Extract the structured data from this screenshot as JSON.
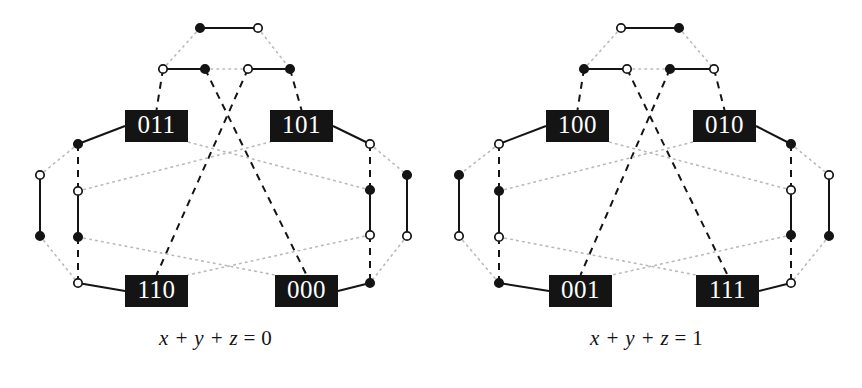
{
  "figure": {
    "background_color": "#ffffff",
    "ink_color": "#141414",
    "box_fill_color": "#141414",
    "box_text_color": "#ffffff",
    "dotted_color": "#b9b9b9",
    "width": 862,
    "height": 388
  },
  "panels": [
    {
      "id": "left",
      "caption": {
        "lhs": "x + y + z",
        "eq": "=",
        "rhs": "0",
        "full": "x + y + z = 0"
      },
      "boxes": [
        {
          "id": "box-011",
          "label": "011",
          "x": 125,
          "y": 110,
          "w": 63,
          "h": 32
        },
        {
          "id": "box-101",
          "label": "101",
          "x": 270,
          "y": 110,
          "w": 63,
          "h": 32
        },
        {
          "id": "box-110",
          "label": "110",
          "x": 125,
          "y": 275,
          "w": 63,
          "h": 32
        },
        {
          "id": "box-000",
          "label": "000",
          "x": 275,
          "y": 275,
          "w": 63,
          "h": 32
        }
      ],
      "nodes": [
        {
          "id": "t1",
          "x": 200,
          "y": 28,
          "fill": "filled"
        },
        {
          "id": "t2",
          "x": 258,
          "y": 28,
          "fill": "open"
        },
        {
          "id": "r1",
          "x": 163,
          "y": 69,
          "fill": "open"
        },
        {
          "id": "r2",
          "x": 205,
          "y": 69,
          "fill": "filled"
        },
        {
          "id": "r3",
          "x": 248,
          "y": 69,
          "fill": "open"
        },
        {
          "id": "r4",
          "x": 290,
          "y": 69,
          "fill": "filled"
        },
        {
          "id": "l1",
          "x": 78,
          "y": 144,
          "fill": "filled"
        },
        {
          "id": "l2",
          "x": 40,
          "y": 175,
          "fill": "open"
        },
        {
          "id": "l3",
          "x": 78,
          "y": 191,
          "fill": "open"
        },
        {
          "id": "l4",
          "x": 40,
          "y": 236,
          "fill": "filled"
        },
        {
          "id": "l5",
          "x": 78,
          "y": 237,
          "fill": "filled"
        },
        {
          "id": "l6",
          "x": 78,
          "y": 283,
          "fill": "open"
        },
        {
          "id": "g1",
          "x": 370,
          "y": 144,
          "fill": "open"
        },
        {
          "id": "g2",
          "x": 407,
          "y": 175,
          "fill": "filled"
        },
        {
          "id": "g3",
          "x": 370,
          "y": 190,
          "fill": "filled"
        },
        {
          "id": "g4",
          "x": 407,
          "y": 236,
          "fill": "open"
        },
        {
          "id": "g5",
          "x": 370,
          "y": 235,
          "fill": "open"
        },
        {
          "id": "g6",
          "x": 370,
          "y": 283,
          "fill": "filled"
        }
      ]
    },
    {
      "id": "right",
      "caption": {
        "lhs": "x + y + z",
        "eq": "=",
        "rhs": "1",
        "full": "x + y + z = 1"
      },
      "boxes": [
        {
          "id": "box-100",
          "label": "100",
          "x": 115,
          "y": 110,
          "w": 63,
          "h": 32
        },
        {
          "id": "box-010",
          "label": "010",
          "x": 262,
          "y": 110,
          "w": 63,
          "h": 32
        },
        {
          "id": "box-001",
          "label": "001",
          "x": 118,
          "y": 275,
          "w": 63,
          "h": 32
        },
        {
          "id": "box-111",
          "label": "111",
          "x": 265,
          "y": 275,
          "w": 63,
          "h": 32
        }
      ],
      "nodes": [
        {
          "id": "t1",
          "x": 190,
          "y": 28,
          "fill": "open"
        },
        {
          "id": "t2",
          "x": 248,
          "y": 28,
          "fill": "filled"
        },
        {
          "id": "r1",
          "x": 153,
          "y": 69,
          "fill": "filled"
        },
        {
          "id": "r2",
          "x": 196,
          "y": 69,
          "fill": "open"
        },
        {
          "id": "r3",
          "x": 239,
          "y": 69,
          "fill": "filled"
        },
        {
          "id": "r4",
          "x": 283,
          "y": 69,
          "fill": "open"
        },
        {
          "id": "l1",
          "x": 68,
          "y": 144,
          "fill": "open"
        },
        {
          "id": "l2",
          "x": 28,
          "y": 175,
          "fill": "filled"
        },
        {
          "id": "l3",
          "x": 68,
          "y": 191,
          "fill": "filled"
        },
        {
          "id": "l4",
          "x": 28,
          "y": 236,
          "fill": "open"
        },
        {
          "id": "l5",
          "x": 68,
          "y": 237,
          "fill": "open"
        },
        {
          "id": "l6",
          "x": 68,
          "y": 283,
          "fill": "filled"
        },
        {
          "id": "g1",
          "x": 360,
          "y": 144,
          "fill": "filled"
        },
        {
          "id": "g2",
          "x": 398,
          "y": 175,
          "fill": "open"
        },
        {
          "id": "g3",
          "x": 360,
          "y": 190,
          "fill": "open"
        },
        {
          "id": "g4",
          "x": 398,
          "y": 236,
          "fill": "filled"
        },
        {
          "id": "g5",
          "x": 360,
          "y": 235,
          "fill": "filled"
        },
        {
          "id": "g6",
          "x": 360,
          "y": 283,
          "fill": "open"
        }
      ]
    }
  ],
  "edge_styles": {
    "solid": {
      "stroke": "#141414",
      "width": 2,
      "dash": "none"
    },
    "dashed": {
      "stroke": "#141414",
      "width": 2,
      "dash": "7 6"
    },
    "dotted": {
      "stroke": "#b9b9b9",
      "width": 1.6,
      "dash": "1.5 4.5"
    }
  }
}
